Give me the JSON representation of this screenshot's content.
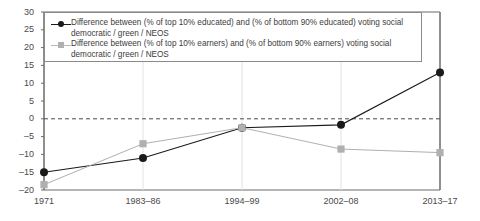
{
  "chart_data": {
    "type": "line",
    "title": "",
    "subtitle": "",
    "xlabel": "",
    "ylabel": "",
    "categories": [
      "1971",
      "1983–86",
      "1994–99",
      "2002–08",
      "2013–17"
    ],
    "ylim": [
      -20,
      30
    ],
    "yticks": [
      30,
      25,
      20,
      15,
      10,
      5,
      0,
      -5,
      -10,
      -15,
      -20
    ],
    "ytick_labels": [
      "30",
      "25",
      "20",
      "15",
      "10",
      "5",
      "0",
      "–5",
      "–10",
      "–15",
      "–20"
    ],
    "grid": false,
    "vertical_gridlines": true,
    "zero_reference_line": 0,
    "legend_position": "top-left-inside",
    "series": [
      {
        "name": "Difference between (% of top 10% educated) and (% of bottom 90% educated) voting social democratic / green / NEOS",
        "marker": "circle",
        "color": "#1a1a1a",
        "values": [
          -15,
          -11,
          -2.5,
          -1.7,
          13
        ]
      },
      {
        "name": "Difference between (% of top 10% earners) and (% of bottom 90% earners) voting social democratic / green / NEOS",
        "marker": "square",
        "color": "#b0b0b0",
        "values": [
          -18.5,
          -7,
          -2.5,
          -8.5,
          -9.5
        ]
      }
    ]
  },
  "legend": {
    "entries": [
      {
        "marker_name": "legend-marker-educated",
        "label": "Difference between (% of top 10% educated) and (% of bottom 90% educated) voting social democratic / green / NEOS"
      },
      {
        "marker_name": "legend-marker-earners",
        "label": "Difference between (% of top 10% earners) and (% of bottom 90% earners) voting social democratic / green / NEOS"
      }
    ]
  },
  "colors": {
    "series_educated": "#1a1a1a",
    "series_earners": "#b0b0b0",
    "axis": "#6b6b6b",
    "text": "#3c3c3c",
    "background": "#ffffff"
  }
}
